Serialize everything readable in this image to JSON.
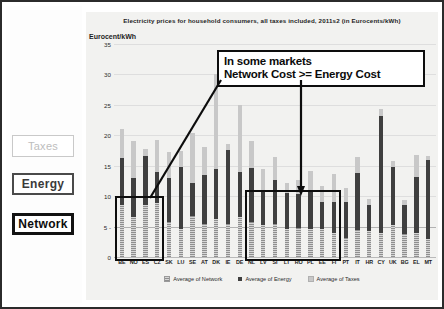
{
  "side_labels": {
    "taxes": "Taxes",
    "energy": "Energy",
    "network": "Network"
  },
  "callout": {
    "line1": "In some markets",
    "line2": "Network Cost >= Energy Cost"
  },
  "chart_data": {
    "type": "bar",
    "subtype": "stacked",
    "title": "Electricity prices for household consumers, all taxes included, 2011s2 (in Eurocents/kWh)",
    "xlabel": "",
    "ylabel": "Eurocent/kWh",
    "ylim": [
      0,
      35
    ],
    "yticks": [
      0,
      5,
      10,
      15,
      20,
      25,
      30,
      35
    ],
    "grid": true,
    "legend_position": "bottom",
    "categories": [
      "BE",
      "NO",
      "ES",
      "CZ",
      "SK",
      "LU",
      "SE",
      "AT",
      "DK",
      "IE",
      "DE",
      "NL",
      "LV",
      "SI",
      "LT",
      "RO",
      "PL",
      "EE",
      "FI",
      "PT",
      "IT",
      "HR",
      "CY",
      "UK",
      "BG",
      "EL",
      "MT"
    ],
    "series": [
      {
        "name": "Average of Network",
        "values": [
          8.6,
          6.6,
          8.6,
          8.8,
          5.8,
          4.6,
          6.8,
          5.4,
          6.2,
          5.4,
          6.6,
          5.8,
          5.2,
          5.4,
          4.6,
          4.8,
          4.6,
          4.6,
          4.0,
          3.2,
          4.4,
          4.2,
          4.0,
          5.2,
          3.8,
          4.0,
          3.0
        ]
      },
      {
        "name": "Average of Energy",
        "values": [
          7.6,
          6.4,
          8.0,
          5.2,
          7.2,
          10.2,
          5.4,
          8.0,
          8.2,
          12.2,
          7.4,
          8.8,
          5.8,
          7.2,
          6.0,
          5.6,
          6.2,
          4.4,
          5.0,
          5.8,
          9.4,
          4.4,
          19.2,
          9.6,
          4.8,
          9.2,
          13.0
        ]
      },
      {
        "name": "Average of Taxes",
        "values": [
          4.8,
          6.0,
          1.2,
          5.2,
          4.2,
          2.6,
          8.2,
          4.6,
          15.6,
          1.0,
          11.0,
          4.4,
          3.4,
          3.8,
          1.6,
          2.2,
          3.4,
          2.6,
          4.6,
          2.4,
          2.6,
          1.0,
          1.2,
          1.0,
          0.8,
          3.6,
          0.6
        ]
      }
    ],
    "legend": [
      "Average of Network",
      "Average of Energy",
      "Average of Taxes"
    ],
    "colors": {
      "network": "#8f8f8f",
      "energy": "#3f3f3f",
      "taxes": "#c8c8c8",
      "annotation": "#0d0d0d"
    },
    "annotations": [
      {
        "name": "highlight-group-1",
        "categories": [
          "BE",
          "NO",
          "ES",
          "CZ"
        ],
        "y_range": [
          0,
          10
        ]
      },
      {
        "name": "highlight-group-2",
        "categories": [
          "NL",
          "LV",
          "SI",
          "LT",
          "RO",
          "PL",
          "EE",
          "FI"
        ],
        "y_range": [
          0,
          11
        ]
      }
    ]
  }
}
